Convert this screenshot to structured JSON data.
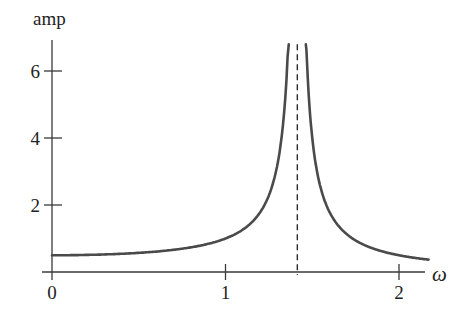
{
  "chart_data": {
    "type": "line",
    "title": "",
    "xlabel": "ω",
    "ylabel": "amp",
    "xlim": [
      0,
      2.17
    ],
    "ylim": [
      0,
      6.8
    ],
    "xticks": [
      0,
      1,
      2
    ],
    "xtick_labels": [
      "0",
      "1",
      "2"
    ],
    "yticks": [
      2,
      4,
      6
    ],
    "ytick_labels": [
      "2",
      "4",
      "6"
    ],
    "grid": false,
    "legend": null,
    "asymptote": {
      "x": 1.414,
      "style": "dashed",
      "label": ""
    },
    "series": [
      {
        "name": "amplitude (left branch)",
        "x": [
          0,
          0.2,
          0.4,
          0.6,
          0.8,
          1.0,
          1.1,
          1.2,
          1.25,
          1.3,
          1.33,
          1.35,
          1.365
        ],
        "y": [
          0.5,
          0.51,
          0.54,
          0.61,
          0.74,
          1.0,
          1.27,
          1.79,
          2.29,
          3.22,
          4.35,
          5.4,
          6.8
        ]
      },
      {
        "name": "amplitude (right branch)",
        "x": [
          1.463,
          1.48,
          1.5,
          1.55,
          1.6,
          1.7,
          1.8,
          1.9,
          2.0,
          2.1,
          2.17
        ],
        "y": [
          6.8,
          5.0,
          4.0,
          2.49,
          1.79,
          1.12,
          0.81,
          0.62,
          0.5,
          0.41,
          0.37
        ]
      }
    ]
  },
  "labels": {
    "ylabel": "amp",
    "xlabel": "ω",
    "xticks": [
      "0",
      "1",
      "2"
    ],
    "yticks": [
      "2",
      "4",
      "6"
    ]
  }
}
